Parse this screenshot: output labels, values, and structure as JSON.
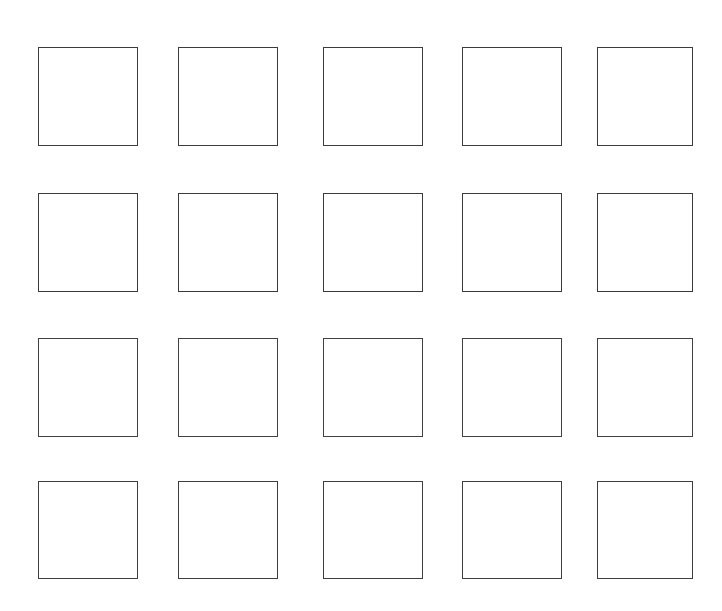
{
  "page": {
    "kind": "blank-square-grid-worksheet",
    "background_color": "#ffffff",
    "width": 722,
    "height": 611
  },
  "grid": {
    "rows": 4,
    "columns": 5,
    "cell_count": 20,
    "cell_width": 100,
    "cell_height": 99,
    "stroke_color": "#3a3a3c",
    "stroke_width": 1.5,
    "fill_color": "#ffffff",
    "column_left_edges": [
      38,
      178,
      323,
      462,
      597
    ],
    "row_top_edges": [
      47,
      193,
      338,
      481
    ],
    "cells": [
      {
        "row": 0,
        "col": 0,
        "x": 38,
        "y": 47,
        "w": 100,
        "h": 99,
        "content": ""
      },
      {
        "row": 0,
        "col": 1,
        "x": 178,
        "y": 47,
        "w": 100,
        "h": 99,
        "content": ""
      },
      {
        "row": 0,
        "col": 2,
        "x": 323,
        "y": 47,
        "w": 100,
        "h": 99,
        "content": ""
      },
      {
        "row": 0,
        "col": 3,
        "x": 462,
        "y": 47,
        "w": 100,
        "h": 99,
        "content": ""
      },
      {
        "row": 0,
        "col": 4,
        "x": 597,
        "y": 47,
        "w": 96,
        "h": 99,
        "content": ""
      },
      {
        "row": 1,
        "col": 0,
        "x": 38,
        "y": 193,
        "w": 100,
        "h": 99,
        "content": ""
      },
      {
        "row": 1,
        "col": 1,
        "x": 178,
        "y": 193,
        "w": 100,
        "h": 99,
        "content": ""
      },
      {
        "row": 1,
        "col": 2,
        "x": 323,
        "y": 193,
        "w": 100,
        "h": 99,
        "content": ""
      },
      {
        "row": 1,
        "col": 3,
        "x": 462,
        "y": 193,
        "w": 100,
        "h": 99,
        "content": ""
      },
      {
        "row": 1,
        "col": 4,
        "x": 597,
        "y": 193,
        "w": 96,
        "h": 99,
        "content": ""
      },
      {
        "row": 2,
        "col": 0,
        "x": 38,
        "y": 338,
        "w": 100,
        "h": 99,
        "content": ""
      },
      {
        "row": 2,
        "col": 1,
        "x": 178,
        "y": 338,
        "w": 100,
        "h": 99,
        "content": ""
      },
      {
        "row": 2,
        "col": 2,
        "x": 323,
        "y": 338,
        "w": 100,
        "h": 99,
        "content": ""
      },
      {
        "row": 2,
        "col": 3,
        "x": 462,
        "y": 338,
        "w": 100,
        "h": 99,
        "content": ""
      },
      {
        "row": 2,
        "col": 4,
        "x": 597,
        "y": 338,
        "w": 96,
        "h": 99,
        "content": ""
      },
      {
        "row": 3,
        "col": 0,
        "x": 38,
        "y": 481,
        "w": 100,
        "h": 98,
        "content": ""
      },
      {
        "row": 3,
        "col": 1,
        "x": 178,
        "y": 481,
        "w": 100,
        "h": 98,
        "content": ""
      },
      {
        "row": 3,
        "col": 2,
        "x": 323,
        "y": 481,
        "w": 100,
        "h": 98,
        "content": ""
      },
      {
        "row": 3,
        "col": 3,
        "x": 462,
        "y": 481,
        "w": 100,
        "h": 98,
        "content": ""
      },
      {
        "row": 3,
        "col": 4,
        "x": 597,
        "y": 481,
        "w": 96,
        "h": 98,
        "content": ""
      }
    ]
  }
}
